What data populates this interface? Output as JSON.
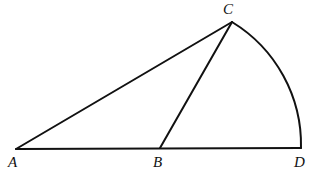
{
  "figure": {
    "kind": "geometry-diagram",
    "background_color": "#ffffff",
    "stroke_color": "#111111",
    "stroke_width": 2,
    "canvas": {
      "width": 315,
      "height": 177
    },
    "points": {
      "A": {
        "label": "A",
        "x": 16,
        "y": 149
      },
      "B": {
        "label": "B",
        "x": 160,
        "y": 148
      },
      "C": {
        "label": "C",
        "x": 232,
        "y": 22
      },
      "D": {
        "label": "D",
        "x": 301,
        "y": 148
      }
    },
    "segments": [
      {
        "name": "AD",
        "from": "A",
        "to": "D",
        "path": "M 16 149 L 301 148"
      },
      {
        "name": "AC",
        "from": "A",
        "to": "C",
        "path": "M 16 149 L 232 22"
      },
      {
        "name": "BC",
        "from": "B",
        "to": "C",
        "path": "M 160 148 L 232 22"
      }
    ],
    "arcs": [
      {
        "name": "CD",
        "from": "C",
        "to": "D",
        "center": "B",
        "radius": 144,
        "sweep": "clockwise",
        "path": "M 232 22 A 144 144 0 0 1 301 148"
      }
    ],
    "labels": {
      "A": "A",
      "B": "B",
      "C": "C",
      "D": "D"
    }
  }
}
